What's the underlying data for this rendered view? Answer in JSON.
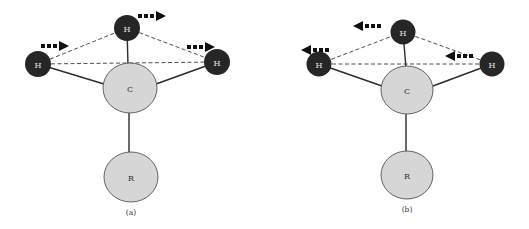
{
  "diagram": {
    "atom_labels": {
      "hydrogen": "H",
      "carbon": "C",
      "substituent": "R"
    },
    "panels": [
      {
        "id": "a",
        "label": "(a)",
        "motion_direction": "right",
        "arrows": [
          {
            "on_atom": "left-H",
            "direction": "right"
          },
          {
            "on_atom": "top-H",
            "direction": "right"
          },
          {
            "on_atom": "right-H",
            "direction": "right"
          }
        ]
      },
      {
        "id": "b",
        "label": "(b)",
        "motion_direction": "left",
        "arrows": [
          {
            "on_atom": "left-H",
            "direction": "left"
          },
          {
            "on_atom": "top-H",
            "direction": "left"
          },
          {
            "on_atom": "right-H",
            "direction": "left"
          }
        ]
      }
    ],
    "colors": {
      "hydrogen_fill": "#262626",
      "heavy_atom_fill": "#d6d6d6",
      "arrow": "#111111"
    }
  }
}
